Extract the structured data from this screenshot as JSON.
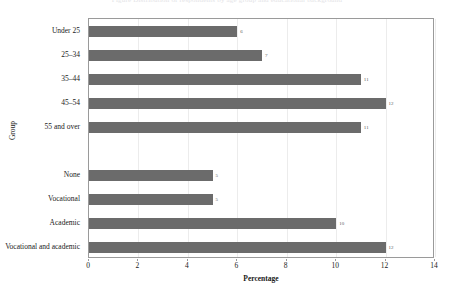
{
  "caption_remnant": "Figure  Distribution of respondents by age group and educational background",
  "chart_data": {
    "type": "bar",
    "orientation": "horizontal",
    "title": "",
    "xlabel": "Percentage",
    "ylabel": "Group",
    "xlim": [
      0,
      14
    ],
    "xticks": [
      0,
      2,
      4,
      6,
      8,
      10,
      12,
      14
    ],
    "xtick_labels": [
      "0",
      "2",
      "4",
      "6",
      "8",
      "10",
      "12",
      "14"
    ],
    "grid": "vertical",
    "legend": "none",
    "bar_color": "#6b6b6b",
    "categories": [
      "Under 25",
      "25–34",
      "35–44",
      "45–54",
      "55 and over",
      "",
      "None",
      "Vocational",
      "Academic",
      "Vocational and academic"
    ],
    "values": [
      6,
      7,
      11,
      12,
      11,
      null,
      5,
      5,
      10,
      12
    ],
    "value_labels": [
      "6",
      "7",
      "11",
      "12",
      "11",
      "",
      "5",
      "5",
      "10",
      "12"
    ],
    "bars": [
      {
        "category": "Under 25",
        "value": 6,
        "label": "6"
      },
      {
        "category": "25–34",
        "value": 7,
        "label": "7"
      },
      {
        "category": "35–44",
        "value": 11,
        "label": "11"
      },
      {
        "category": "45–54",
        "value": 12,
        "label": "12"
      },
      {
        "category": "55 and over",
        "value": 11,
        "label": "11"
      },
      {
        "category": "",
        "value": null,
        "label": ""
      },
      {
        "category": "None",
        "value": 5,
        "label": "5"
      },
      {
        "category": "Vocational",
        "value": 5,
        "label": "5"
      },
      {
        "category": "Academic",
        "value": 10,
        "label": "10"
      },
      {
        "category": "Vocational and academic",
        "value": 12,
        "label": "12"
      }
    ]
  }
}
